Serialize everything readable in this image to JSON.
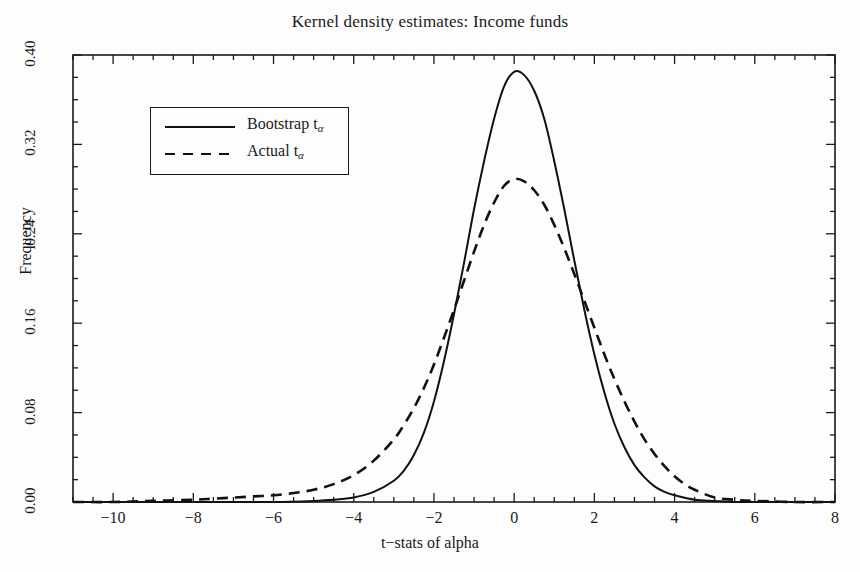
{
  "chart_data": {
    "type": "line",
    "title": "Kernel density estimates: Income funds",
    "xlabel": "t−stats of alpha",
    "ylabel": "Frequency",
    "xlim": [
      -11,
      8
    ],
    "ylim": [
      0.0,
      0.4
    ],
    "grid": false,
    "legend_position": "upper-left",
    "xticks": [
      -10,
      -8,
      -6,
      -4,
      -2,
      0,
      2,
      4,
      6,
      8
    ],
    "xtick_labels": [
      "−10",
      "−8",
      "−6",
      "−4",
      "−2",
      "0",
      "2",
      "4",
      "6",
      "8"
    ],
    "yticks": [
      0.0,
      0.08,
      0.16,
      0.24,
      0.32,
      0.4
    ],
    "ytick_labels": [
      "0.00",
      "0.08",
      "0.16",
      "0.24",
      "0.32",
      "0.40"
    ],
    "x_minor_tick_step": 0.5,
    "y_minor_tick_step": 0.02,
    "series": [
      {
        "name": "Bootstrap t_alpha",
        "legend_label": "Bootstrap t",
        "legend_subscript": "α",
        "style": "solid",
        "color": "#111111",
        "peak_x": 0.0,
        "peak_y": 0.385,
        "x": [
          -11.0,
          -10.0,
          -9.0,
          -8.0,
          -7.0,
          -6.0,
          -5.0,
          -4.5,
          -4.0,
          -3.5,
          -3.0,
          -2.75,
          -2.5,
          -2.25,
          -2.0,
          -1.75,
          -1.5,
          -1.25,
          -1.0,
          -0.75,
          -0.5,
          -0.25,
          0.0,
          0.25,
          0.5,
          0.75,
          1.0,
          1.25,
          1.5,
          1.75,
          2.0,
          2.25,
          2.5,
          2.75,
          3.0,
          3.25,
          3.5,
          3.75,
          4.0,
          4.5,
          5.0,
          5.5,
          6.0,
          7.0,
          8.0
        ],
        "y": [
          0.0,
          0.0,
          0.0,
          0.0,
          0.0,
          0.0,
          0.001,
          0.002,
          0.004,
          0.009,
          0.019,
          0.028,
          0.042,
          0.062,
          0.09,
          0.126,
          0.168,
          0.214,
          0.262,
          0.305,
          0.343,
          0.372,
          0.385,
          0.382,
          0.368,
          0.343,
          0.305,
          0.262,
          0.216,
          0.172,
          0.132,
          0.098,
          0.07,
          0.049,
          0.033,
          0.022,
          0.014,
          0.009,
          0.006,
          0.002,
          0.001,
          0.0,
          0.0,
          0.0,
          0.0
        ]
      },
      {
        "name": "Actual t_alpha",
        "legend_label": "Actual t",
        "legend_subscript": "α",
        "style": "dashed",
        "color": "#111111",
        "peak_x": -0.15,
        "peak_y": 0.29,
        "x": [
          -11.0,
          -10.0,
          -9.0,
          -8.0,
          -7.5,
          -7.0,
          -6.5,
          -6.0,
          -5.5,
          -5.0,
          -4.5,
          -4.0,
          -3.5,
          -3.0,
          -2.75,
          -2.5,
          -2.25,
          -2.0,
          -1.75,
          -1.5,
          -1.25,
          -1.0,
          -0.75,
          -0.5,
          -0.25,
          0.0,
          0.25,
          0.5,
          0.75,
          1.0,
          1.25,
          1.5,
          1.75,
          2.0,
          2.25,
          2.5,
          2.75,
          3.0,
          3.25,
          3.5,
          3.75,
          4.0,
          4.25,
          4.5,
          5.0,
          5.5,
          6.0,
          7.0,
          8.0
        ],
        "y": [
          0.0,
          0.0,
          0.001,
          0.002,
          0.003,
          0.004,
          0.005,
          0.006,
          0.008,
          0.011,
          0.016,
          0.024,
          0.037,
          0.056,
          0.069,
          0.084,
          0.102,
          0.123,
          0.147,
          0.172,
          0.198,
          0.224,
          0.248,
          0.268,
          0.283,
          0.289,
          0.287,
          0.279,
          0.266,
          0.248,
          0.227,
          0.204,
          0.18,
          0.156,
          0.132,
          0.11,
          0.09,
          0.072,
          0.056,
          0.043,
          0.032,
          0.023,
          0.016,
          0.011,
          0.004,
          0.002,
          0.001,
          0.0,
          0.0
        ]
      }
    ]
  }
}
